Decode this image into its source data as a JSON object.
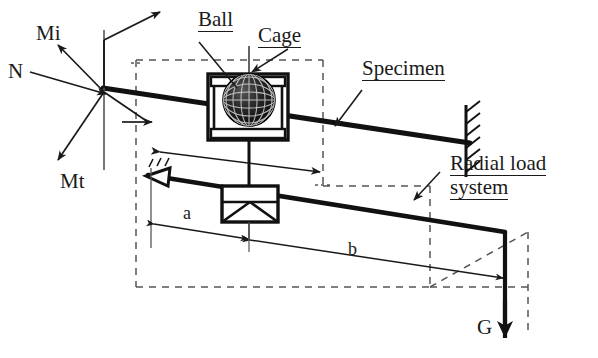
{
  "figure": {
    "type": "engineering-diagram",
    "background_color": "#ffffff",
    "line_color": "#1a1a1a",
    "dashed_color": "#555555"
  },
  "labels": {
    "normal_force": "N",
    "moment_inertia": "Mi",
    "moment_torque": "Mt",
    "ball": "Ball",
    "cage": "Cage",
    "specimen": "Specimen",
    "radial_load_line1": "Radial load",
    "radial_load_line2": "system",
    "dimension_a": "a",
    "dimension_b": "b",
    "weight": "G"
  },
  "components": [
    {
      "name": "ball",
      "label": "Ball",
      "description": "dark textured sphere inside cage housing"
    },
    {
      "name": "cage",
      "label": "Cage",
      "description": "rectangular housing enclosing the ball"
    },
    {
      "name": "specimen",
      "label": "Specimen",
      "description": "inclined bar ending at hatched fixed support"
    },
    {
      "name": "radial-load-system",
      "label": "Radial load system",
      "description": "lower lever arm assembly carrying weight G"
    },
    {
      "name": "pivot-support",
      "label": "",
      "description": "triangular hatched pivot at left end of lever"
    },
    {
      "name": "fulcrum-box",
      "label": "",
      "description": "boxed fulcrum with internal triangles under cage"
    },
    {
      "name": "fixed-support",
      "label": "",
      "description": "vertical hatched wall fixing the specimen"
    }
  ],
  "force_system": {
    "origin_description": "convergence point of force and moment vectors at left of specimen",
    "vectors": [
      {
        "name": "N",
        "label": "N",
        "direction": "incoming from upper-left to origin"
      },
      {
        "name": "Mi",
        "label": "Mi",
        "direction": "outgoing to upper-left"
      },
      {
        "name": "Mt",
        "label": "Mt",
        "direction": "outgoing to lower-left"
      },
      {
        "name": "axial-up",
        "label": "",
        "direction": "outgoing to upper-right"
      },
      {
        "name": "axial-right",
        "label": "",
        "direction": "outgoing to right"
      }
    ]
  },
  "dimensions": [
    {
      "name": "a",
      "label": "a",
      "description": "distance from pivot to fulcrum box"
    },
    {
      "name": "b",
      "label": "b",
      "description": "distance from fulcrum box to weight G"
    }
  ],
  "loads": [
    {
      "name": "G",
      "label": "G",
      "direction": "downward",
      "description": "dead weight at end of lever arm"
    }
  ]
}
